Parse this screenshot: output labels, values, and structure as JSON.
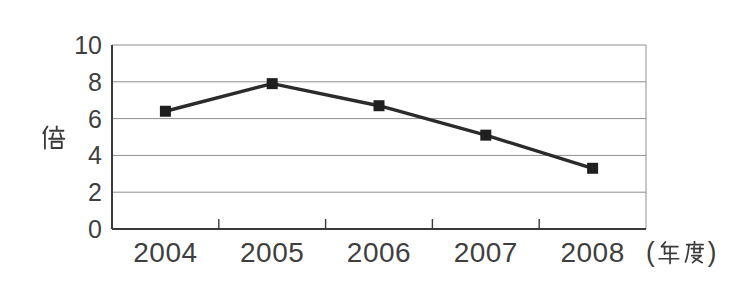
{
  "chart_data": {
    "type": "line",
    "categories": [
      "2004",
      "2005",
      "2006",
      "2007",
      "2008"
    ],
    "values": [
      6.4,
      7.9,
      6.7,
      5.1,
      3.3
    ],
    "series": [
      {
        "name": "ratio",
        "values": [
          6.4,
          7.9,
          6.7,
          5.1,
          3.3
        ]
      }
    ],
    "title": "",
    "xlabel": "(年度)",
    "xlabel_parts": {
      "open": "(",
      "kanji": "年度",
      "close": ")"
    },
    "ylabel": "倍",
    "ylim": [
      0,
      10
    ],
    "yticks": [
      0,
      2,
      4,
      6,
      8,
      10
    ],
    "grid": "horizontal",
    "legend": "none",
    "marker": "square",
    "colors": {
      "line": "#2b2b2b",
      "marker": "#1f1f1f",
      "grid": "#8f8f8f",
      "axis": "#3a3a3a",
      "text": "#3f3f3f",
      "background": "#ffffff"
    }
  }
}
